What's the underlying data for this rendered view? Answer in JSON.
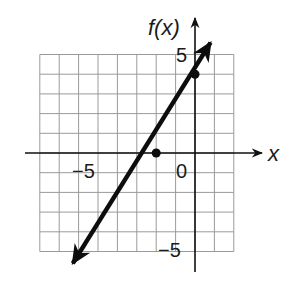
{
  "chart_data": {
    "type": "line",
    "title": "",
    "xlabel": "x",
    "ylabel": "f(x)",
    "xlim": [
      -8,
      2
    ],
    "ylim": [
      -5,
      5
    ],
    "grid": true,
    "grid_step": 1,
    "tick_labels": {
      "x": [
        {
          "value": -5,
          "label": "−5"
        },
        {
          "value": 0,
          "label": "0"
        }
      ],
      "y": [
        {
          "value": 5,
          "label": "5"
        },
        {
          "value": -5,
          "label": "−5"
        }
      ]
    },
    "series": [
      {
        "name": "f(x) = 2x + 4",
        "equation": "f(x) = 2x + 4",
        "slope": 2,
        "intercept": 4,
        "x": [
          -6.3,
          0.8
        ],
        "y": [
          -5.6,
          5.6
        ],
        "arrows": "both",
        "marked_points": [
          {
            "x": -2,
            "y": 0
          },
          {
            "x": 0,
            "y": 4
          }
        ]
      }
    ]
  },
  "labels": {
    "y_axis": "f(x)",
    "x_axis": "x",
    "x_tick_neg5": "−5",
    "x_tick_0": "0",
    "y_tick_5": "5",
    "y_tick_neg5": "−5"
  },
  "colors": {
    "grid": "#9a9a9a",
    "axis": "#111111",
    "line": "#0d0d0d"
  }
}
